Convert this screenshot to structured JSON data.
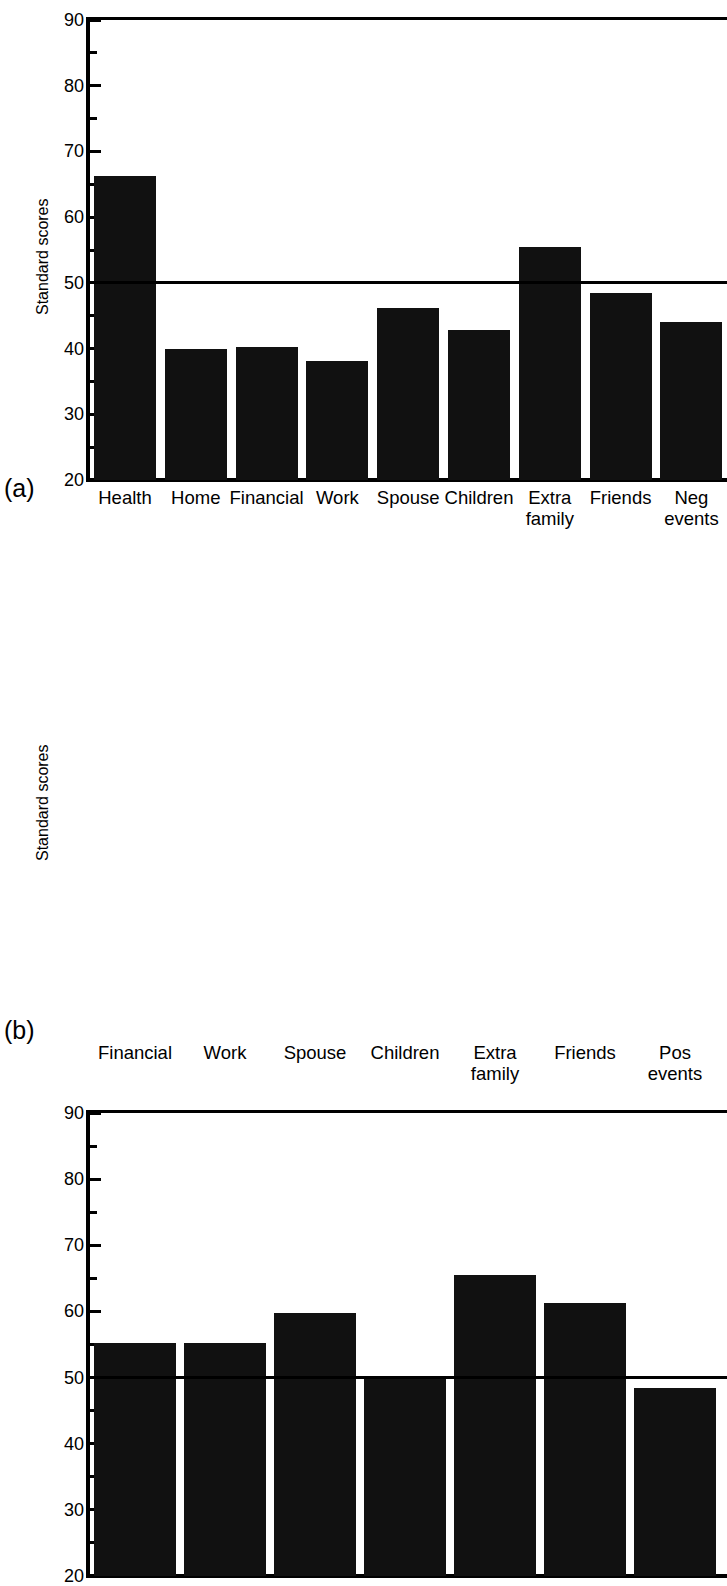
{
  "figure": {
    "panels": [
      {
        "letter": "(a)",
        "chart_data": {
          "type": "bar",
          "title": "",
          "xlabel": "",
          "ylabel": "Standard scores",
          "ylim": [
            20,
            90
          ],
          "ytick_major": [
            20,
            30,
            40,
            50,
            60,
            70,
            80,
            90
          ],
          "ytick_minor": [
            25,
            35,
            45,
            55,
            65,
            75,
            85
          ],
          "grid": false,
          "reference_line": 50,
          "bar_color": "#111111",
          "categories": [
            "Health",
            "Home",
            "Financial",
            "Work",
            "Spouse",
            "Children",
            "Extra\nfamily",
            "Friends",
            "Neg\nevents"
          ],
          "values": [
            66.2,
            40.0,
            40.3,
            38.1,
            46.2,
            42.8,
            55.5,
            48.5,
            44.0
          ]
        }
      },
      {
        "letter": "(b)",
        "chart_data": {
          "type": "bar",
          "title": "",
          "xlabel": "",
          "ylabel": "Standard scores",
          "ylim": [
            20,
            90
          ],
          "ytick_major": [
            20,
            30,
            40,
            50,
            60,
            70,
            80,
            90
          ],
          "ytick_minor": [
            25,
            35,
            45,
            55,
            65,
            75,
            85
          ],
          "grid": false,
          "reference_line": 50,
          "bar_color": "#111111",
          "categories": [
            "Financial",
            "Work",
            "Spouse",
            "Children",
            "Extra\nfamily",
            "Friends",
            "Pos\nevents"
          ],
          "values": [
            55.2,
            55.3,
            59.7,
            50.3,
            65.5,
            61.3,
            48.4
          ]
        }
      }
    ]
  }
}
